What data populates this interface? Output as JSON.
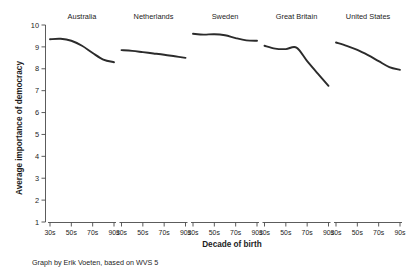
{
  "chart_data": {
    "type": "line",
    "title": "",
    "xlabel": "Decade of birth",
    "ylabel": "Average importance of democracy",
    "categories": [
      "30s",
      "50s",
      "70s",
      "90s"
    ],
    "x": [
      1930,
      1950,
      1970,
      1990
    ],
    "ylim": [
      1,
      10
    ],
    "yticks": [
      1,
      2,
      3,
      4,
      5,
      6,
      7,
      8,
      9,
      10
    ],
    "ytick_labels": [
      "1",
      "2",
      "3",
      "4",
      "5",
      "6",
      "7",
      "8",
      "9",
      "10"
    ],
    "grid": false,
    "legend": "none",
    "layout": "small-multiples, 5 panels in one row, shared y-axis on left",
    "line_color": "#2b2b2b",
    "series": [
      {
        "name": "Australia",
        "x": [
          1930,
          1940,
          1950,
          1960,
          1970,
          1980,
          1990
        ],
        "values": [
          9.35,
          9.37,
          9.28,
          9.05,
          8.72,
          8.42,
          8.3
        ]
      },
      {
        "name": "Netherlands",
        "x": [
          1930,
          1940,
          1950,
          1960,
          1970,
          1980,
          1990
        ],
        "values": [
          8.85,
          8.82,
          8.76,
          8.7,
          8.64,
          8.57,
          8.5
        ]
      },
      {
        "name": "Sweden",
        "x": [
          1930,
          1940,
          1950,
          1960,
          1970,
          1980,
          1990
        ],
        "values": [
          9.6,
          9.56,
          9.58,
          9.53,
          9.4,
          9.3,
          9.28
        ]
      },
      {
        "name": "Great Britain",
        "x": [
          1930,
          1940,
          1950,
          1960,
          1970,
          1980,
          1990
        ],
        "values": [
          9.05,
          8.92,
          8.9,
          8.97,
          8.35,
          7.78,
          7.22
        ]
      },
      {
        "name": "United States",
        "x": [
          1930,
          1940,
          1950,
          1960,
          1970,
          1980,
          1990
        ],
        "values": [
          9.2,
          9.05,
          8.86,
          8.62,
          8.35,
          8.08,
          7.95
        ]
      }
    ],
    "annotations": [
      "Graph by Erik Voeten, based on WVS 5"
    ]
  },
  "footnote": {
    "text": "Graph by Erik Voeten, based on WVS 5"
  },
  "axes": {
    "x_title": "Decade of birth",
    "y_title": "Average importance of democracy"
  }
}
